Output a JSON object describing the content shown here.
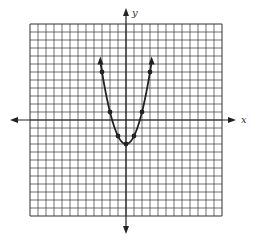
{
  "chart_data": {
    "type": "line",
    "title": "",
    "xlabel": "x",
    "ylabel": "y",
    "equation": "y = x^2 - 3",
    "xlim": [
      -12,
      12
    ],
    "ylim": [
      -12,
      12
    ],
    "grid": true,
    "grid_step": 1,
    "x": [
      -3,
      -2,
      -1,
      0,
      1,
      2,
      3
    ],
    "y": [
      6,
      1,
      -2,
      -3,
      -2,
      1,
      6
    ],
    "marked_points": [
      [
        -3,
        6
      ],
      [
        -2,
        1
      ],
      [
        -1,
        -2
      ],
      [
        0,
        -3
      ],
      [
        1,
        -2
      ],
      [
        2,
        1
      ],
      [
        3,
        6
      ]
    ],
    "curve_extends_to": [
      [
        -3.2,
        7.2
      ],
      [
        3.2,
        7.2
      ]
    ],
    "curve_arrows": true,
    "colors": {
      "grid": "#333333",
      "curve": "#222222",
      "background": "#ffffff"
    }
  },
  "labels": {
    "x_axis": "x",
    "y_axis": "y"
  }
}
